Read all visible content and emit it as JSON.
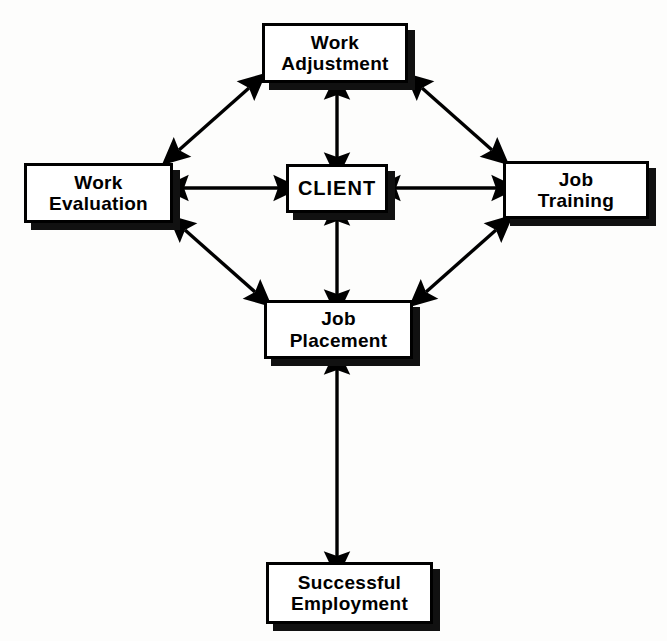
{
  "diagram": {
    "type": "flow-diagram",
    "background_color": "#fdfdfc",
    "line_color": "#000000",
    "box_fill": "#ffffff",
    "shadow_color": "#111111",
    "nodes": [
      {
        "id": "work-adjustment",
        "label": "Work\nAdjustment"
      },
      {
        "id": "work-evaluation",
        "label": "Work\nEvaluation"
      },
      {
        "id": "client",
        "label": "CLIENT"
      },
      {
        "id": "job-training",
        "label": "Job\nTraining"
      },
      {
        "id": "job-placement",
        "label": "Job\nPlacement"
      },
      {
        "id": "successful-employment",
        "label": "Successful\nEmployment"
      }
    ],
    "connections": [
      {
        "id": "work-evaluation--work-adjustment",
        "from": "work-evaluation",
        "to": "work-adjustment",
        "style": "double-arrow",
        "orientation": "diagonal"
      },
      {
        "id": "work-adjustment--job-training",
        "from": "work-adjustment",
        "to": "job-training",
        "style": "double-arrow",
        "orientation": "diagonal"
      },
      {
        "id": "work-evaluation--job-placement",
        "from": "work-evaluation",
        "to": "job-placement",
        "style": "double-arrow",
        "orientation": "diagonal"
      },
      {
        "id": "job-placement--job-training",
        "from": "job-placement",
        "to": "job-training",
        "style": "double-arrow",
        "orientation": "diagonal"
      },
      {
        "id": "work-evaluation--client",
        "from": "work-evaluation",
        "to": "client",
        "style": "double-arrow",
        "orientation": "horizontal"
      },
      {
        "id": "client--job-training",
        "from": "client",
        "to": "job-training",
        "style": "double-arrow",
        "orientation": "horizontal"
      },
      {
        "id": "work-adjustment--client",
        "from": "work-adjustment",
        "to": "client",
        "style": "double-arrow",
        "orientation": "vertical"
      },
      {
        "id": "client--job-placement",
        "from": "client",
        "to": "job-placement",
        "style": "double-arrow",
        "orientation": "vertical"
      },
      {
        "id": "job-placement--successful-employment",
        "from": "job-placement",
        "to": "successful-employment",
        "style": "double-arrow",
        "orientation": "vertical"
      }
    ]
  }
}
